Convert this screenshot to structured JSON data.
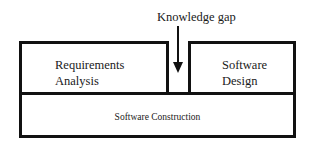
{
  "diagram": {
    "gap_label": "Knowledge gap",
    "boxes": {
      "requirements": {
        "line1": "Requirements",
        "line2": "Analysis"
      },
      "design": {
        "line1": "Software",
        "line2": "Design"
      },
      "construction": {
        "label": "Software Construction"
      }
    },
    "colors": {
      "stroke": "#111111",
      "background": "#ffffff",
      "text": "#1a1a1a"
    }
  }
}
